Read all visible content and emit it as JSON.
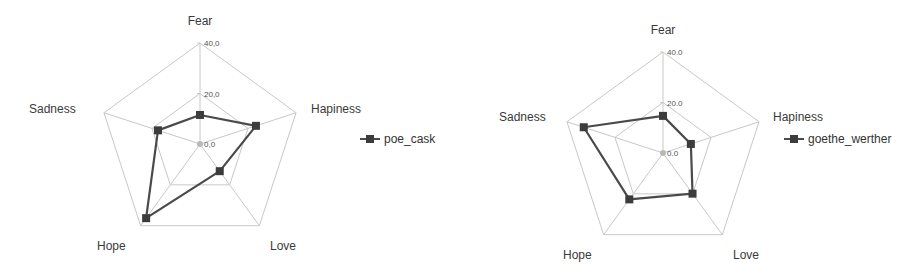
{
  "colors": {
    "grid": "#c8c8c8",
    "series_line": "#4a4a4a",
    "series_marker": "#3c3c3c",
    "center_marker": "#b8b8b8",
    "text": "#3a3a3a"
  },
  "chart_data": [
    {
      "type": "radar",
      "title": "",
      "categories": [
        "Fear",
        "Hapiness",
        "Love",
        "Hope",
        "Sadness"
      ],
      "series": [
        {
          "name": "poe_cask",
          "values": [
            11.5,
            23.3,
            13.3,
            36.3,
            17.5
          ]
        }
      ],
      "rlim": [
        0,
        40
      ],
      "r_ticks": [
        0,
        20,
        40
      ],
      "r_tick_labels": [
        "0,0",
        "20,0",
        "40,0"
      ],
      "grid": true,
      "legend_position": "right"
    },
    {
      "type": "radar",
      "title": "",
      "categories": [
        "Fear",
        "Hapiness",
        "Love",
        "Hope",
        "Sadness"
      ],
      "series": [
        {
          "name": "goethe_werther",
          "values": [
            14.7,
            11.6,
            19.9,
            22.7,
            33.0
          ]
        }
      ],
      "rlim": [
        0,
        40
      ],
      "r_ticks": [
        0,
        20,
        40
      ],
      "r_tick_labels": [
        "0.0",
        "20.0",
        "40.0"
      ],
      "grid": true,
      "legend_position": "right"
    }
  ],
  "layout": [
    {
      "left": 0,
      "width": 450,
      "cx": 200,
      "cy": 144,
      "R": 101,
      "labels": [
        {
          "x": 200,
          "y": 25,
          "anchor": "middle"
        },
        {
          "x": 311,
          "y": 113,
          "anchor": "start"
        },
        {
          "x": 270,
          "y": 250,
          "anchor": "start"
        },
        {
          "x": 97,
          "y": 250,
          "anchor": "start"
        },
        {
          "x": 29,
          "y": 113,
          "anchor": "start"
        }
      ],
      "legend": {
        "x": 360,
        "y": 139
      }
    },
    {
      "left": 450,
      "width": 455,
      "cx": 213,
      "cy": 153,
      "R": 101,
      "labels": [
        {
          "x": 213,
          "y": 34,
          "anchor": "middle"
        },
        {
          "x": 323,
          "y": 121,
          "anchor": "start"
        },
        {
          "x": 283,
          "y": 259,
          "anchor": "start"
        },
        {
          "x": 113,
          "y": 259,
          "anchor": "start"
        },
        {
          "x": 49,
          "y": 121,
          "anchor": "start"
        }
      ],
      "legend": {
        "x": 334,
        "y": 139
      }
    }
  ]
}
